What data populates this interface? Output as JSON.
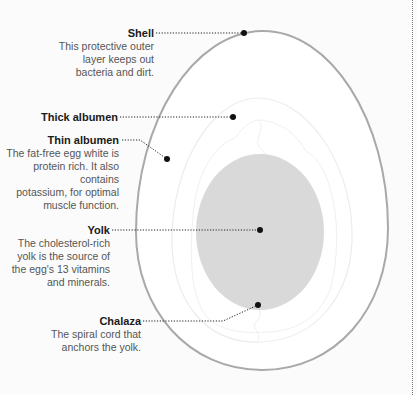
{
  "diagram": {
    "type": "anatomy-of-an-egg",
    "colors": {
      "shell_stroke": "#a9a9a9",
      "yolk_fill": "#d9d9d9",
      "albumen_stroke": "#ececec",
      "leader": "#222222",
      "background": "#fbfbfb"
    },
    "labels": [
      {
        "id": "shell",
        "title": "Shell",
        "description": "This protective outer\nlayer keeps out\nbacteria and dirt."
      },
      {
        "id": "thick-albumen",
        "title": "Thick albumen",
        "description": ""
      },
      {
        "id": "thin-albumen",
        "title": "Thin albumen",
        "description": "The fat-free egg white is\nprotein rich. It also contains\npotassium, for optimal\nmuscle function."
      },
      {
        "id": "yolk",
        "title": "Yolk",
        "description": "The cholesterol-rich\nyolk is the source of\nthe egg's 13 vitamins\nand minerals."
      },
      {
        "id": "chalaza",
        "title": "Chalaza",
        "description": "The spiral cord that\nanchors the yolk."
      }
    ]
  }
}
